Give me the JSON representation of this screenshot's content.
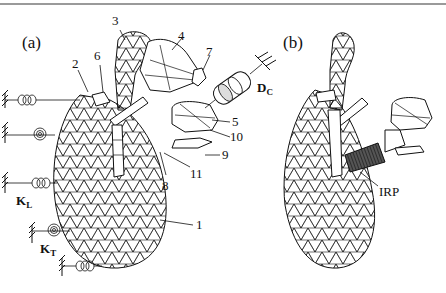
{
  "figure": {
    "panels": [
      {
        "id": "a",
        "label": "(a)",
        "part_labels": [
          "1",
          "2",
          "3",
          "4",
          "5",
          "6",
          "7",
          "8",
          "9",
          "10",
          "11"
        ],
        "symbols": {
          "damper": {
            "main": "D",
            "sub": "C"
          },
          "linear_spring": {
            "main": "K",
            "sub": "L"
          },
          "torsional_spring": {
            "main": "K",
            "sub": "T"
          }
        }
      },
      {
        "id": "b",
        "label": "(b)",
        "annotation": "IRP"
      }
    ],
    "colors": {
      "line": "#111111",
      "top_rule": "#9a9a9a",
      "irp_fill": "#333333",
      "background": "#ffffff"
    }
  }
}
